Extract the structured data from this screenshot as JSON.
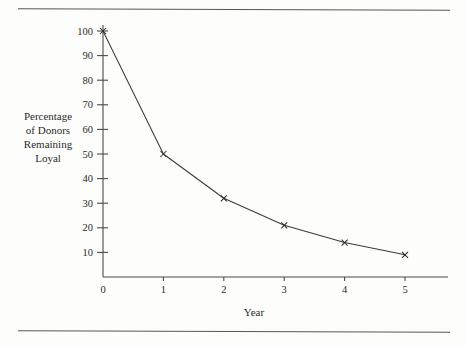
{
  "chart_data": {
    "type": "line",
    "title": "",
    "subtitle": "",
    "xlabel": "Year",
    "ylabel": "Percentage of Donors Remaining Loyal",
    "ylabel_lines": [
      "Percentage",
      "of Donors",
      "Remaining",
      "Loyal"
    ],
    "x": [
      0,
      1,
      2,
      3,
      4,
      5
    ],
    "values": [
      100,
      50,
      32,
      21,
      14,
      9
    ],
    "categories": [
      "0",
      "1",
      "2",
      "3",
      "4",
      "5"
    ],
    "series": [
      {
        "name": "Percentage of Donors Remaining Loyal",
        "values": [
          100,
          50,
          32,
          21,
          14,
          9
        ]
      }
    ],
    "xlim": [
      0,
      5
    ],
    "ylim": [
      0,
      100
    ],
    "xticks": [
      "0",
      "1",
      "2",
      "3",
      "4",
      "5"
    ],
    "yticks": [
      "10",
      "20",
      "30",
      "40",
      "50",
      "60",
      "70",
      "80",
      "90",
      "100"
    ],
    "ytick_values": [
      10,
      20,
      30,
      40,
      50,
      60,
      70,
      80,
      90,
      100
    ],
    "grid": false,
    "legend": false,
    "legend_position": "none",
    "marker": "x-cross",
    "line_color": "#3b3b3b",
    "axis_color": "#4a4a4a",
    "background_color": "#fdfdfc",
    "annotations": []
  },
  "decorations": {
    "top_rule": "horizontal-rule",
    "bottom_rule": "horizontal-rule"
  }
}
